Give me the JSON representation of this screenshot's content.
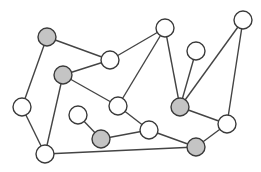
{
  "diagram": {
    "type": "undirected-graph",
    "colors": {
      "white_fill": "#ffffff",
      "gray_fill": "#c4c4c4",
      "edge": "#444444",
      "stroke": "#3a3a3a"
    },
    "nodes": [
      {
        "id": "A",
        "fill": "gray"
      },
      {
        "id": "B",
        "fill": "white"
      },
      {
        "id": "C",
        "fill": "white"
      },
      {
        "id": "D",
        "fill": "white"
      },
      {
        "id": "E",
        "fill": "white"
      },
      {
        "id": "F",
        "fill": "gray"
      },
      {
        "id": "G",
        "fill": "white"
      },
      {
        "id": "H",
        "fill": "white"
      },
      {
        "id": "I",
        "fill": "gray"
      },
      {
        "id": "J",
        "fill": "white"
      },
      {
        "id": "K",
        "fill": "white"
      },
      {
        "id": "L",
        "fill": "gray"
      },
      {
        "id": "M",
        "fill": "white"
      },
      {
        "id": "N",
        "fill": "gray"
      },
      {
        "id": "O",
        "fill": "white"
      }
    ],
    "edges": [
      [
        "A",
        "B"
      ],
      [
        "A",
        "G"
      ],
      [
        "B",
        "C"
      ],
      [
        "B",
        "F"
      ],
      [
        "C",
        "H"
      ],
      [
        "C",
        "I"
      ],
      [
        "E",
        "I"
      ],
      [
        "D",
        "I"
      ],
      [
        "D",
        "J"
      ],
      [
        "F",
        "H"
      ],
      [
        "F",
        "O"
      ],
      [
        "G",
        "O"
      ],
      [
        "H",
        "M"
      ],
      [
        "I",
        "J"
      ],
      [
        "K",
        "L"
      ],
      [
        "L",
        "M"
      ],
      [
        "M",
        "N"
      ],
      [
        "J",
        "N"
      ],
      [
        "O",
        "N"
      ]
    ]
  }
}
